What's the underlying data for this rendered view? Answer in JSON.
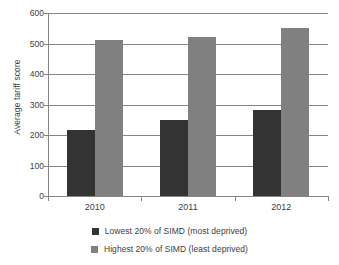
{
  "chart_data": {
    "type": "bar",
    "title": "",
    "xlabel": "",
    "ylabel": "Average tariff score",
    "categories": [
      "2010",
      "2011",
      "2012"
    ],
    "series": [
      {
        "name": "Lowest 20% of SIMD (most deprived)",
        "color": "#333333",
        "values": [
          218,
          250,
          282
        ]
      },
      {
        "name": "Highest 20% of SIMD (least deprived)",
        "color": "#808080",
        "values": [
          510,
          520,
          550
        ]
      }
    ],
    "ylim": [
      0,
      600
    ],
    "ytick_labels": [
      "0",
      "100",
      "200",
      "300",
      "400",
      "500",
      "600"
    ],
    "ytick_values": [
      0,
      100,
      200,
      300,
      400,
      500,
      600
    ],
    "grid": true,
    "legend_position": "bottom"
  },
  "legend": {
    "items": [
      {
        "label": "Lowest 20% of SIMD (most deprived)",
        "color": "#333333"
      },
      {
        "label": "Highest 20% of SIMD (least deprived)",
        "color": "#808080"
      }
    ]
  },
  "colors": {
    "low_deprivation_bar": "#333333",
    "high_deprivation_bar": "#808080",
    "gridline": "#858585",
    "text": "#404040",
    "background": "#ffffff"
  }
}
